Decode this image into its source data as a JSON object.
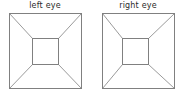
{
  "figure": {
    "title_present": false,
    "background_color": "#ffffff",
    "line_color": "#808080",
    "label_color": "#2b2b2b",
    "panels": [
      {
        "id": "left-eye",
        "label": "left eye",
        "outer_square": {
          "x1": 9,
          "y1": 13,
          "x2": 81,
          "y2": 88
        },
        "inner_square": {
          "x1": 32,
          "y1": 38,
          "x2": 58,
          "y2": 64
        },
        "diagonals": [
          {
            "from": "outer-top-left",
            "to": "inner-top-left"
          },
          {
            "from": "outer-top-right",
            "to": "inner-top-right"
          },
          {
            "from": "outer-bottom-left",
            "to": "inner-bottom-left"
          },
          {
            "from": "outer-bottom-right",
            "to": "inner-bottom-right"
          }
        ]
      },
      {
        "id": "right-eye",
        "label": "right eye",
        "outer_square": {
          "x1": 102,
          "y1": 13,
          "x2": 174,
          "y2": 88
        },
        "inner_square": {
          "x1": 122,
          "y1": 38,
          "x2": 148,
          "y2": 64
        },
        "diagonals": [
          {
            "from": "outer-top-left",
            "to": "inner-top-left"
          },
          {
            "from": "outer-top-right",
            "to": "inner-top-right"
          },
          {
            "from": "outer-bottom-left",
            "to": "inner-bottom-left"
          },
          {
            "from": "outer-bottom-right",
            "to": "inner-bottom-right"
          }
        ]
      }
    ]
  }
}
